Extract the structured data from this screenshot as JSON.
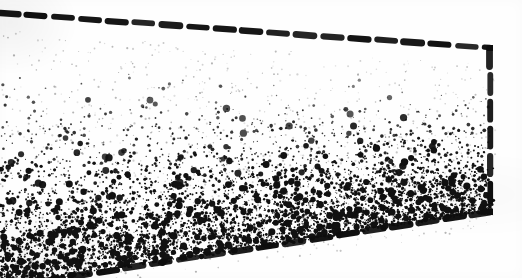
{
  "figure": {
    "caption": "",
    "background_color": "#fefefe",
    "ink_color": "#111111",
    "width": 522,
    "height": 278
  },
  "chart_data": {
    "type": "scatter",
    "subtitle": "",
    "xlabel": "",
    "ylabel": "",
    "xlim": [
      0,
      522
    ],
    "ylim": [
      0,
      278
    ],
    "grid": false,
    "legend": null,
    "tick_labels_x": [],
    "tick_labels_y": [],
    "annotations": [],
    "marker": {
      "shape": "dot",
      "color": "#111111",
      "min_size_px": 1,
      "max_size_px": 3
    },
    "boundary": {
      "style": "dashed",
      "color": "#0d0d0d",
      "line_width_px": 6,
      "dash_length_px": 18,
      "dash_gap_px": 9,
      "closed": false,
      "description": "Open-left quadrilateral: top edge slopes down to the right, right edge is vertical, bottom edge slopes up to the right. No line on the left edge.",
      "edges": [
        {
          "name": "top-edge",
          "from": [
            0,
            13
          ],
          "to": [
            490,
            48
          ],
          "orientation": "slanted-down-right"
        },
        {
          "name": "right-edge",
          "from": [
            490,
            48
          ],
          "to": [
            490,
            212
          ],
          "orientation": "vertical"
        },
        {
          "name": "bottom-edge",
          "from": [
            490,
            212
          ],
          "to": [
            0,
            288
          ],
          "orientation": "slanted-down-left"
        }
      ],
      "corners": [
        {
          "name": "top-right-corner",
          "x": 490,
          "y": 48
        },
        {
          "name": "bottom-right-corner",
          "x": 490,
          "y": 212
        }
      ]
    },
    "density_profile": {
      "description": "Point density increases monotonically from the top boundary toward the bottom boundary; greatest concentration along the bottom-left.",
      "axis": "vertical",
      "top_density_relative": 0.0,
      "bottom_density_relative": 1.0,
      "gradient_exponent": 3.1,
      "empty_band_below_top_edge_px": 42,
      "total_points": 5200,
      "bands": [
        {
          "label": "upper",
          "y_fraction_range": [
            0.0,
            0.25
          ],
          "relative_density": 0.02
        },
        {
          "label": "upper-middle",
          "y_fraction_range": [
            0.25,
            0.5
          ],
          "relative_density": 0.12
        },
        {
          "label": "lower-middle",
          "y_fraction_range": [
            0.5,
            0.75
          ],
          "relative_density": 0.42
        },
        {
          "label": "lower",
          "y_fraction_range": [
            0.75,
            1.0
          ],
          "relative_density": 1.0
        }
      ],
      "horizontal_bias": {
        "description": "Slight extra concentration toward the left side near the bottom",
        "left_relative": 1.15,
        "right_relative": 0.9
      }
    }
  }
}
